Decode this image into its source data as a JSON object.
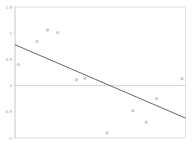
{
  "chart_data": {
    "type": "scatter",
    "title": "",
    "xlabel": "",
    "ylabel": "",
    "ylim": [
      -1,
      1.5
    ],
    "yticks": [
      1.5,
      1,
      0.5,
      0,
      -0.5,
      -1
    ],
    "ytick_labels": [
      "1.5",
      "1",
      "0.5",
      "0",
      "-0.5",
      "-1"
    ],
    "xticks": [],
    "grid": false,
    "legend": null,
    "reference_line": {
      "y": 0,
      "color": "#cccccc"
    },
    "series": [
      {
        "name": "points",
        "kind": "scatter",
        "marker": "circle",
        "color": "#888888",
        "x": [
          0.02,
          0.13,
          0.19,
          0.25,
          0.36,
          0.41,
          0.54,
          0.69,
          0.77,
          0.83,
          0.98
        ],
        "y": [
          0.4,
          0.84,
          1.06,
          1.01,
          0.11,
          0.14,
          -0.9,
          -0.48,
          -0.7,
          -0.25,
          0.13
        ]
      },
      {
        "name": "fit",
        "kind": "line",
        "color": "#555555",
        "x": [
          0,
          1
        ],
        "y": [
          0.78,
          -0.62
        ]
      }
    ]
  }
}
